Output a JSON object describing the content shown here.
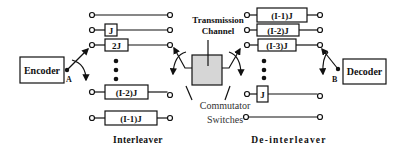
{
  "encoder": {
    "label": "Encoder",
    "point_label": "A"
  },
  "decoder": {
    "label": "Decoder",
    "point_label": "B"
  },
  "interleaver": {
    "title": "Interleaver",
    "rows": [
      {
        "delay": ""
      },
      {
        "delay": "J"
      },
      {
        "delay": "2J"
      },
      {
        "delay": "(I-2)J"
      },
      {
        "delay": "(I-1)J"
      }
    ]
  },
  "deinterleaver": {
    "title": "De-interleaver",
    "rows": [
      {
        "delay": "(I-1)J"
      },
      {
        "delay": "(I-2)J"
      },
      {
        "delay": "(I-3)J"
      },
      {
        "delay": "J"
      },
      {
        "delay": ""
      }
    ]
  },
  "channel": {
    "line1": "Transmission",
    "line2": "Channel"
  },
  "commutator": {
    "line1": "Commutator",
    "line2": "Switches"
  },
  "colors": {
    "channel_fill": "#d6d6d6",
    "stroke": "#111111",
    "commutator_text": "#333333"
  }
}
